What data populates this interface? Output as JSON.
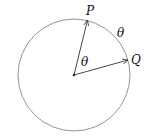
{
  "diagram": {
    "type": "circle-rotation",
    "labels": {
      "point_p": "P",
      "point_q": "Q",
      "angle_center": "θ",
      "arc_angle": "θ"
    },
    "colors": {
      "circle": "#888888",
      "vectors": "#333333",
      "text": "#111111"
    }
  }
}
